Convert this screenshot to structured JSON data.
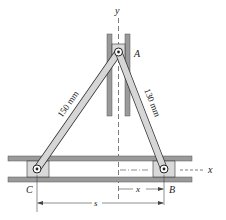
{
  "diagram": {
    "type": "mechanism",
    "labels": {
      "point_a": "A",
      "point_b": "B",
      "point_c": "C",
      "axis_x": "x",
      "axis_y": "y",
      "dim_x": "x",
      "dim_s": "s",
      "rod_ca": "150 mm",
      "rod_ab": "130 mm"
    },
    "colors": {
      "rod_fill": "#d6d6d6",
      "guide_fill": "#9a9a9a",
      "slider_fill": "#d9d9d9",
      "stroke": "#333333"
    }
  }
}
